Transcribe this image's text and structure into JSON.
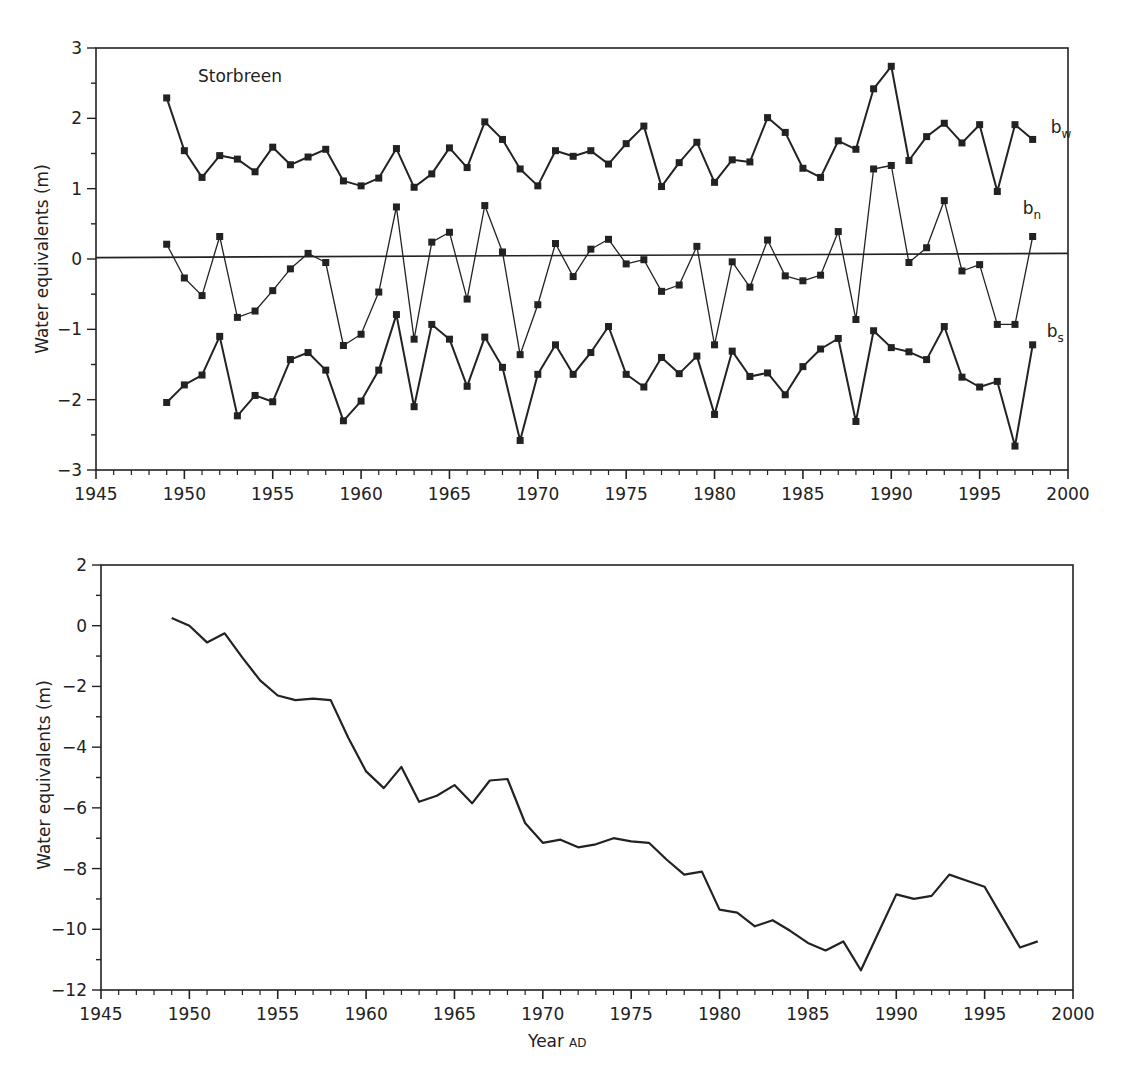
{
  "chart_data": [
    {
      "type": "line",
      "title": "Storbreen",
      "xlabel": "",
      "ylabel": "Water equivalents (m)",
      "xlim": [
        1945,
        2000
      ],
      "ylim": [
        -3,
        3
      ],
      "xticks": [
        1945,
        1950,
        1955,
        1960,
        1965,
        1970,
        1975,
        1980,
        1985,
        1990,
        1995,
        2000
      ],
      "yticks": [
        3,
        2,
        1,
        0,
        -1,
        -2,
        -3
      ],
      "ytick_labels": [
        "3",
        "2",
        "1",
        "0",
        "−1",
        "−2",
        "−3"
      ],
      "grid": false,
      "zero_line": true,
      "markers": "square",
      "x": [
        1949,
        1950,
        1951,
        1952,
        1953,
        1954,
        1955,
        1956,
        1957,
        1958,
        1959,
        1960,
        1961,
        1962,
        1963,
        1964,
        1965,
        1966,
        1967,
        1968,
        1969,
        1970,
        1971,
        1972,
        1973,
        1974,
        1975,
        1976,
        1977,
        1978,
        1979,
        1980,
        1981,
        1982,
        1983,
        1984,
        1985,
        1986,
        1987,
        1988,
        1989,
        1990,
        1991,
        1992,
        1993,
        1994,
        1995,
        1996,
        1997,
        1998
      ],
      "series": [
        {
          "name": "bw",
          "label_main": "b",
          "label_sub": "w",
          "values": [
            2.29,
            1.54,
            1.16,
            1.47,
            1.42,
            1.24,
            1.59,
            1.34,
            1.45,
            1.56,
            1.11,
            1.04,
            1.15,
            1.57,
            1.02,
            1.21,
            1.58,
            1.3,
            1.95,
            1.7,
            1.28,
            1.04,
            1.54,
            1.46,
            1.54,
            1.35,
            1.64,
            1.89,
            1.03,
            1.37,
            1.66,
            1.09,
            1.41,
            1.38,
            2.01,
            1.8,
            1.29,
            1.16,
            1.68,
            1.56,
            2.42,
            2.74,
            1.4,
            1.74,
            1.93,
            1.65,
            1.91,
            0.96,
            1.91,
            1.7
          ]
        },
        {
          "name": "bn",
          "label_main": "b",
          "label_sub": "n",
          "values": [
            0.21,
            -0.27,
            -0.52,
            0.32,
            -0.83,
            -0.74,
            -0.45,
            -0.14,
            0.08,
            -0.05,
            -1.23,
            -1.07,
            -0.47,
            0.74,
            -1.14,
            0.24,
            0.38,
            -0.57,
            0.76,
            0.1,
            -1.36,
            -0.65,
            0.22,
            -0.25,
            0.14,
            0.28,
            -0.07,
            -0.01,
            -0.46,
            -0.37,
            0.18,
            -1.22,
            -0.04,
            -0.4,
            0.27,
            -0.24,
            -0.31,
            -0.23,
            0.39,
            -0.86,
            1.28,
            1.33,
            -0.05,
            0.16,
            0.83,
            -0.17,
            -0.08,
            -0.93,
            -0.93,
            0.32
          ]
        },
        {
          "name": "bs",
          "label_main": "b",
          "label_sub": "s",
          "values": [
            -2.04,
            -1.79,
            -1.65,
            -1.1,
            -2.23,
            -1.94,
            -2.03,
            -1.43,
            -1.33,
            -1.58,
            -2.3,
            -2.02,
            -1.58,
            -0.79,
            -2.1,
            -0.93,
            -1.14,
            -1.81,
            -1.11,
            -1.54,
            -2.58,
            -1.64,
            -1.22,
            -1.64,
            -1.33,
            -0.96,
            -1.64,
            -1.82,
            -1.4,
            -1.63,
            -1.38,
            -2.21,
            -1.31,
            -1.67,
            -1.62,
            -1.93,
            -1.53,
            -1.28,
            -1.13,
            -2.31,
            -1.02,
            -1.26,
            -1.32,
            -1.43,
            -0.96,
            -1.68,
            -1.82,
            -1.74,
            -2.66,
            -1.22
          ]
        }
      ]
    },
    {
      "type": "line",
      "title": "",
      "xlabel_main": "Year",
      "xlabel_suffix": "AD",
      "ylabel": "Water equivalents (m)",
      "xlim": [
        1945,
        2000
      ],
      "ylim": [
        -12,
        2
      ],
      "xticks": [
        1945,
        1950,
        1955,
        1960,
        1965,
        1970,
        1975,
        1980,
        1985,
        1990,
        1995,
        2000
      ],
      "yticks": [
        2,
        0,
        -2,
        -4,
        -6,
        -8,
        -10,
        -12
      ],
      "ytick_labels": [
        "2",
        "0",
        "−2",
        "−4",
        "−6",
        "−8",
        "−10",
        "−12"
      ],
      "grid": false,
      "x": [
        1949,
        1950,
        1951,
        1952,
        1953,
        1954,
        1955,
        1956,
        1957,
        1958,
        1959,
        1960,
        1961,
        1962,
        1963,
        1964,
        1965,
        1966,
        1967,
        1968,
        1969,
        1970,
        1971,
        1972,
        1973,
        1974,
        1975,
        1976,
        1977,
        1978,
        1979,
        1980,
        1981,
        1982,
        1983,
        1984,
        1985,
        1986,
        1987,
        1988,
        1989,
        1990,
        1991,
        1992,
        1993,
        1994,
        1995,
        1996,
        1997,
        1998
      ],
      "series": [
        {
          "name": "Cumulative net balance",
          "values": [
            0.25,
            0.0,
            -0.55,
            -0.25,
            -1.05,
            -1.8,
            -2.3,
            -2.45,
            -2.4,
            -2.45,
            -3.7,
            -4.8,
            -5.35,
            -4.65,
            -5.8,
            -5.6,
            -5.25,
            -5.85,
            -5.1,
            -5.05,
            -6.5,
            -7.15,
            -7.05,
            -7.3,
            -7.2,
            -7.0,
            -7.1,
            -7.15,
            -7.7,
            -8.2,
            -8.1,
            -9.35,
            -9.45,
            -9.9,
            -9.7,
            -10.05,
            -10.45,
            -10.7,
            -10.4,
            -11.35,
            -10.1,
            -8.85,
            -9.0,
            -8.9,
            -8.2,
            -8.4,
            -8.6,
            -9.6,
            -10.6,
            -10.4
          ]
        }
      ]
    }
  ]
}
